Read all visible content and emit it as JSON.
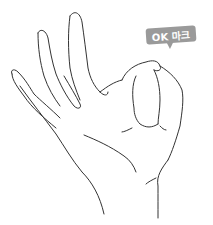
{
  "illustration": {
    "subject": "hand making OK gesture",
    "line_color": "#333333"
  },
  "bubble": {
    "label": "OK 마크",
    "background": "#9a9a9a",
    "text_color": "#ffffff"
  }
}
